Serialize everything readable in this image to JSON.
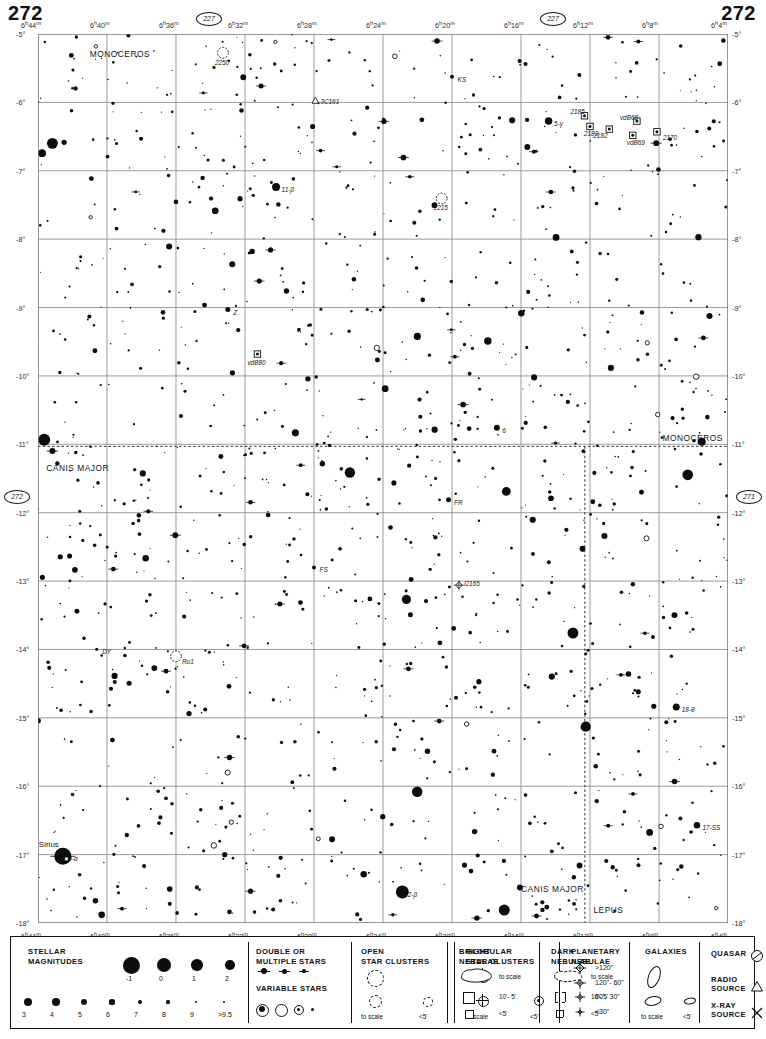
{
  "page": {
    "number_left": "272",
    "number_right": "272",
    "chart_refs": [
      {
        "id": "ref-top-left",
        "label": "227"
      },
      {
        "id": "ref-top-right",
        "label": "227"
      },
      {
        "id": "ref-left",
        "label": "272"
      },
      {
        "id": "ref-right",
        "label": "271"
      },
      {
        "id": "ref-bottom-left",
        "label": "317"
      },
      {
        "id": "ref-bottom-right",
        "label": "317"
      }
    ]
  },
  "chart_data": {
    "type": "scatter",
    "xlabel": "Right Ascension",
    "ylabel": "Declination",
    "xlim": [
      6.0667,
      6.7333
    ],
    "ylim": [
      -18,
      -5
    ],
    "grid": true,
    "ra_ticks": [
      "6h 44m",
      "6h 40m",
      "6h 36m",
      "6h 32m",
      "6h 28m",
      "6h 24m",
      "6h 20m",
      "6h 16m",
      "6h 12m",
      "6h 8m",
      "6h 4m"
    ],
    "ra_tick_values": [
      6.7333,
      6.6667,
      6.6,
      6.5333,
      6.4667,
      6.4,
      6.3333,
      6.2667,
      6.2,
      6.1333,
      6.0667
    ],
    "dec_ticks": [
      "-5°",
      "-6°",
      "-7°",
      "-8°",
      "-9°",
      "-10°",
      "-11°",
      "-12°",
      "-13°",
      "-14°",
      "-15°",
      "-16°",
      "-17°",
      "-18°"
    ],
    "dec_tick_values": [
      -5,
      -6,
      -7,
      -8,
      -9,
      -10,
      -11,
      -12,
      -13,
      -14,
      -15,
      -16,
      -17,
      -18
    ],
    "constellations": [
      {
        "name": "MONOCEROS",
        "x": 0.075,
        "y": 0.022
      },
      {
        "name": "MONOCEROS",
        "x": 0.905,
        "y": 0.455
      },
      {
        "name": "CANIS MAJOR",
        "x": 0.012,
        "y": 0.488
      },
      {
        "name": "CANIS MAJOR",
        "x": 0.7,
        "y": 0.962
      },
      {
        "name": "LEPUS",
        "x": 0.805,
        "y": 0.985
      }
    ],
    "named_stars": [
      {
        "label": "Sirius",
        "designation": "9-α",
        "x": 0.036,
        "y": 0.925,
        "mag": -1.46,
        "size": 17
      },
      {
        "label": "",
        "designation": "11-β",
        "x": 0.345,
        "y": 0.172,
        "mag": 3.7,
        "size": 8
      },
      {
        "label": "",
        "designation": "5-γ",
        "x": 0.74,
        "y": 0.098,
        "mag": 3.99,
        "size": 7.5
      },
      {
        "label": "",
        "designation": "2-β",
        "x": 0.528,
        "y": 0.965,
        "mag": 1.98,
        "size": 13
      },
      {
        "label": "",
        "designation": "18-θ",
        "x": 0.925,
        "y": 0.757,
        "mag": 4.07,
        "size": 7
      },
      {
        "label": "",
        "designation": "17-SS",
        "x": 0.955,
        "y": 0.89,
        "mag": 4.9,
        "size": 6.5
      },
      {
        "label": "",
        "designation": "6",
        "x": 0.665,
        "y": 0.443,
        "mag": 4.8,
        "size": 6
      },
      {
        "label": "",
        "designation": "Z",
        "x": 0.275,
        "y": 0.31,
        "mag": 8.0,
        "size": 5
      },
      {
        "label": "",
        "designation": "KS",
        "x": 0.6,
        "y": 0.048,
        "mag": 8.5,
        "size": 4
      },
      {
        "label": "",
        "designation": "FR",
        "x": 0.595,
        "y": 0.524,
        "mag": 8.0,
        "size": 5
      },
      {
        "label": "",
        "designation": "FS",
        "x": 0.4,
        "y": 0.6,
        "mag": 8.5,
        "size": 4
      },
      {
        "label": "",
        "designation": "DY",
        "x": 0.085,
        "y": 0.692,
        "mag": 9.0,
        "size": 3
      }
    ],
    "deep_sky": [
      {
        "label": "2250",
        "type": "open-cluster",
        "x": 0.268,
        "y": 0.021
      },
      {
        "label": "2215",
        "type": "open-cluster",
        "x": 0.585,
        "y": 0.185
      },
      {
        "label": "Ru1",
        "type": "open-cluster",
        "x": 0.2,
        "y": 0.7
      },
      {
        "label": "3C161",
        "type": "radio-source",
        "x": 0.402,
        "y": 0.075
      },
      {
        "label": "2185",
        "type": "bright-nebula",
        "x": 0.792,
        "y": 0.092
      },
      {
        "label": "2183",
        "type": "bright-nebula",
        "x": 0.8,
        "y": 0.104
      },
      {
        "label": "2182",
        "type": "bright-nebula",
        "x": 0.828,
        "y": 0.107
      },
      {
        "label": "vdB68",
        "type": "bright-nebula",
        "x": 0.868,
        "y": 0.098
      },
      {
        "label": "vdB69",
        "type": "bright-nebula",
        "x": 0.862,
        "y": 0.114
      },
      {
        "label": "2170",
        "type": "bright-nebula",
        "x": 0.897,
        "y": 0.11
      },
      {
        "label": "vdB80",
        "type": "bright-nebula",
        "x": 0.318,
        "y": 0.36
      },
      {
        "label": "I2165",
        "type": "planetary-nebula",
        "x": 0.61,
        "y": 0.62
      }
    ]
  },
  "legend": {
    "sections": [
      {
        "id": "stellar-magnitudes",
        "title": "STELLAR\nMAGNITUDES",
        "title_lines": [
          "STELLAR",
          "MAGNITUDES"
        ],
        "row1_labels": [
          "-1",
          "0",
          "1",
          "2"
        ],
        "row1_sizes": [
          17,
          14,
          11.5,
          9.5
        ],
        "row2_labels": [
          "3",
          "4",
          "5",
          "6",
          "7",
          "8",
          "9",
          ">9.5"
        ],
        "row2_sizes": [
          8.5,
          7.5,
          6.2,
          5.2,
          4.2,
          3.2,
          2.4,
          1.8
        ]
      },
      {
        "id": "double-variable",
        "title_lines": [
          "DOUBLE  OR",
          "MULTIPLE  STARS"
        ],
        "title2_lines": [
          "VARIABLE  STARS"
        ]
      },
      {
        "id": "open-star-clusters",
        "title_lines": [
          "OPEN",
          "STAR CLUSTERS"
        ],
        "labels": [
          "to scale",
          "<5'"
        ]
      },
      {
        "id": "globular-star-clusters",
        "title_lines": [
          "GLOBULAR",
          "STAR CLUSTERS"
        ],
        "labels": [
          "to scale",
          "<5'"
        ]
      },
      {
        "id": "planetary-nebulae",
        "title_lines": [
          "PLANETARY",
          "NEBULAE"
        ],
        "labels": [
          ">120\"",
          "120\"- 60\"",
          "60\"- 30\"",
          "<30\""
        ]
      },
      {
        "id": "bright-nebulae",
        "title_lines": [
          "BRIGHT",
          "NEBULAE"
        ],
        "labels": [
          "to scale",
          "10'- 5'",
          "<5'"
        ]
      },
      {
        "id": "dark-nebulae",
        "title_lines": [
          "DARK",
          "NEBULAE"
        ],
        "labels": [
          "to scale",
          "10'- 5'",
          "<5'"
        ]
      },
      {
        "id": "galaxies",
        "title_lines": [
          "GALAXIES"
        ],
        "labels": [
          "to scale",
          "<5'"
        ]
      },
      {
        "id": "other-objects",
        "rows": [
          {
            "label_lines": [
              "QUASAR"
            ],
            "icon": "quasar-icon"
          },
          {
            "label_lines": [
              "RADIO",
              "SOURCE"
            ],
            "icon": "radio-source-icon"
          },
          {
            "label_lines": [
              "X-RAY",
              "SOURCE"
            ],
            "icon": "xray-source-icon"
          }
        ]
      }
    ]
  }
}
